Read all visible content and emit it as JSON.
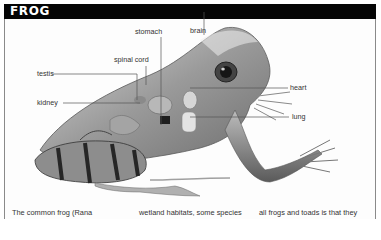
{
  "header": {
    "title": "FROG"
  },
  "diagram": {
    "labels": [
      {
        "id": "stomach",
        "text": "stomach"
      },
      {
        "id": "brain",
        "text": "brain"
      },
      {
        "id": "spinal-cord",
        "text": "spinal cord"
      },
      {
        "id": "testis",
        "text": "testis"
      },
      {
        "id": "kidney",
        "text": "kidney"
      },
      {
        "id": "heart",
        "text": "heart"
      },
      {
        "id": "lung",
        "text": "lung"
      }
    ]
  },
  "body_text": {
    "columns": [
      "The common frog (Rana",
      "wetland habitats, some species",
      "all frogs and toads is that they"
    ]
  },
  "colors": {
    "title_bar": "#050505",
    "title_text": "#ffffff",
    "frame_border": "#8a8a8a",
    "label_text": "#333333",
    "leader_line": "#555555"
  }
}
